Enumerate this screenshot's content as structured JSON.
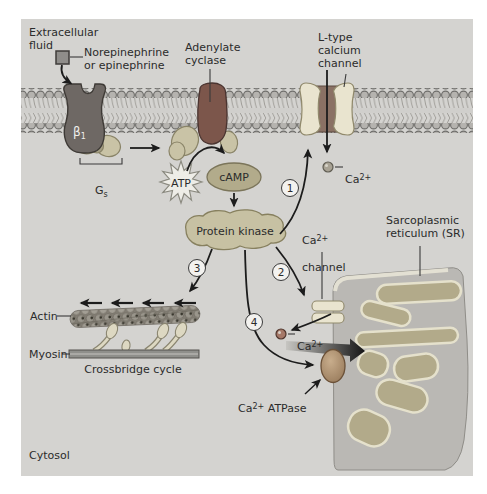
{
  "colors": {
    "page_bg": "#ffffff",
    "panel_bg": "#d4d3d0",
    "text": "#2b2b2b",
    "arrow": "#1c1c1c",
    "membrane_head": "#b5b3af",
    "receptor": "#6e6864",
    "ligand_square": "#8f8d8a",
    "g_protein": "#c9c3a6",
    "adenylate_cyclase": "#7c564b",
    "atp_star": "#eeede7",
    "camp": "#b2ab8b",
    "protein_kinase": "#c7c1a3",
    "channel_cream": "#e9e4cf",
    "ltype_center": "#8a7164",
    "ca_dot_entry": "#a8a294",
    "ca_dot_release": "#a57868",
    "sr_body": "#bab8b4",
    "sr_finger_fill": "#b2aa8a",
    "sr_finger_outline": "#e5e1cc",
    "atpase_pump": "#b59877",
    "myosin_bar": "#8f8f8b"
  },
  "regions": {
    "extracellular": "Extracellular\nfluid",
    "cytosol": "Cytosol"
  },
  "ligand": {
    "label": "Norepinephrine\nor epinephrine"
  },
  "receptor": {
    "base": "β",
    "sub": "1"
  },
  "g_protein": {
    "base": "G",
    "sub": "s"
  },
  "enzymes": {
    "adenylate_cyclase": "Adenylate\ncyclase",
    "protein_kinase": "Protein kinase"
  },
  "messengers": {
    "atp": "ATP",
    "camp": "cAMP"
  },
  "channels": {
    "l_type": "L-type\ncalcium\nchannel",
    "sr_channel": {
      "base": "Ca",
      "sup": "2+",
      "line2": "channel"
    }
  },
  "calcium": {
    "entry": {
      "base": "Ca",
      "sup": "2+"
    },
    "released": {
      "base": "Ca",
      "sup": "2+"
    },
    "atpase": {
      "base": "Ca",
      "sup": "2+",
      "rest": " ATPase"
    }
  },
  "sr": {
    "label": "Sarcoplasmic\nreticulum (SR)"
  },
  "contraction": {
    "actin": "Actin",
    "myosin": "Myosin",
    "crossbridge": "Crossbridge cycle"
  },
  "steps": {
    "s1": "1",
    "s2": "2",
    "s3": "3",
    "s4": "4"
  }
}
